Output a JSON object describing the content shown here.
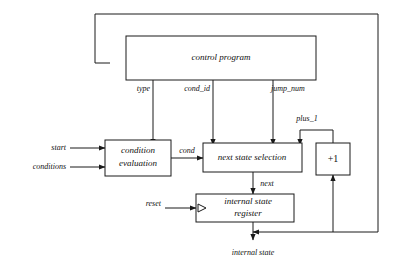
{
  "diagram": {
    "boxes": [
      {
        "id": "control_program",
        "label": "control program",
        "style": "italic"
      },
      {
        "id": "condition_evaluation",
        "label_line1": "condition",
        "label_line2": "evaluation",
        "style": "italic"
      },
      {
        "id": "next_state_selection",
        "label": "next state selection",
        "style": "italic"
      },
      {
        "id": "internal_state_register",
        "label_line1": "internal state",
        "label_line2": "register",
        "style": "italic"
      },
      {
        "id": "incrementer",
        "label": "+1",
        "style": "plain"
      }
    ],
    "signals": {
      "start": "start",
      "conditions": "conditions",
      "type": "type",
      "cond_id": "cond_id",
      "jump_num": "jump_num",
      "plus_1": "plus_1",
      "cond": "cond",
      "next": "next",
      "reset": "reset",
      "internal_state": "internal state"
    },
    "colors": {
      "line": "#1a1a1a",
      "box_fill": "#ffffff",
      "text": "#111111",
      "background": "#ffffff"
    }
  }
}
